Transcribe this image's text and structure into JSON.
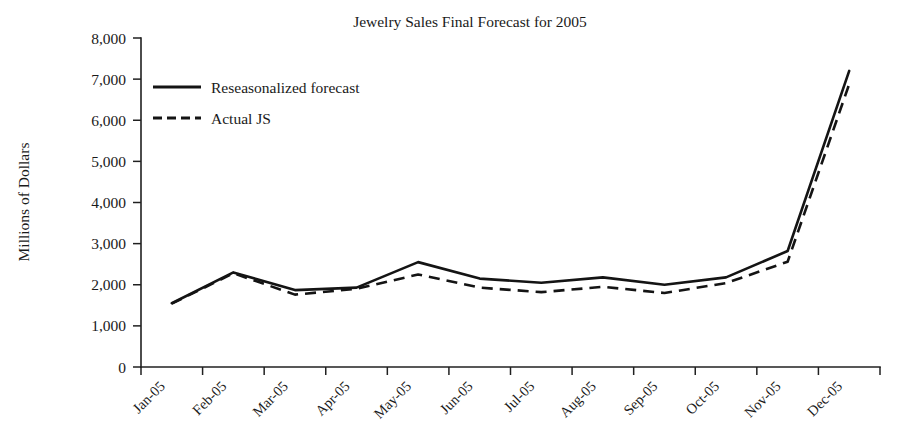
{
  "chart_data": {
    "type": "line",
    "title": "Jewelry Sales Final Forecast for 2005",
    "xlabel": "",
    "ylabel": "Millions of Dollars",
    "categories": [
      "Jan-05",
      "Feb-05",
      "Mar-05",
      "Apr-05",
      "May-05",
      "Jun-05",
      "Jul-05",
      "Aug-05",
      "Sep-05",
      "Oct-05",
      "Nov-05",
      "Dec-05"
    ],
    "ylim": [
      0,
      8000
    ],
    "yticks": [
      0,
      1000,
      2000,
      3000,
      4000,
      5000,
      6000,
      7000,
      8000
    ],
    "ytick_labels": [
      "0",
      "1,000",
      "2,000",
      "3,000",
      "4,000",
      "5,000",
      "6,000",
      "7,000",
      "8,000"
    ],
    "grid": false,
    "legend_position": "upper-left-inside",
    "series": [
      {
        "name": "Reseasonalized forecast",
        "style": "solid",
        "color": "#141414",
        "values": [
          1550,
          2300,
          1870,
          1930,
          2550,
          2150,
          2050,
          2180,
          2000,
          2180,
          2820,
          7200
        ]
      },
      {
        "name": "Actual JS",
        "style": "dashed",
        "color": "#141414",
        "values": [
          1540,
          2280,
          1760,
          1900,
          2250,
          1930,
          1820,
          1950,
          1800,
          2040,
          2560,
          6880
        ]
      }
    ]
  },
  "axis": {
    "y_title": "Millions of Dollars"
  }
}
